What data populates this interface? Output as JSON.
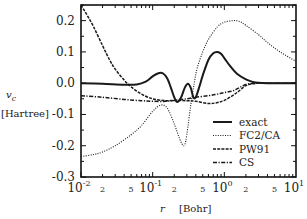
{
  "chart_data": {
    "type": "line",
    "title": "",
    "xlabel_symbol": "r",
    "xlabel_unit": "[Bohr]",
    "ylabel_symbol": "v",
    "ylabel_subscript": "c",
    "ylabel_unit": "[Hartree]",
    "xscale": "log",
    "xlim": [
      0.01,
      10
    ],
    "ylim": [
      -0.3,
      0.25
    ],
    "grid": false,
    "legend_position": "bottom-right",
    "x_major_ticks": [
      {
        "value": 0.01,
        "base": "10",
        "exp": "-2"
      },
      {
        "value": 0.1,
        "base": "10",
        "exp": "-1"
      },
      {
        "value": 1,
        "base": "10",
        "exp": "0"
      },
      {
        "value": 10,
        "base": "10",
        "exp": "1"
      }
    ],
    "x_minor_labels": [
      {
        "value": 0.02,
        "label": "2"
      },
      {
        "value": 0.05,
        "label": "5"
      },
      {
        "value": 0.2,
        "label": "2"
      },
      {
        "value": 0.5,
        "label": "5"
      },
      {
        "value": 2,
        "label": "2"
      },
      {
        "value": 5,
        "label": "5"
      }
    ],
    "y_ticks": [
      {
        "value": 0.2,
        "label": "0.2"
      },
      {
        "value": 0.1,
        "label": "0.1"
      },
      {
        "value": 0.0,
        "label": "0.0"
      },
      {
        "value": -0.1,
        "label": "-0.1"
      },
      {
        "value": -0.2,
        "label": "-0.2"
      },
      {
        "value": -0.3,
        "label": "-0.3"
      }
    ],
    "series": [
      {
        "name": "exact",
        "style": "solid",
        "x": [
          0.01,
          0.02,
          0.04,
          0.06,
          0.08,
          0.1,
          0.12,
          0.14,
          0.16,
          0.18,
          0.2,
          0.22,
          0.25,
          0.28,
          0.31,
          0.34,
          0.37,
          0.4,
          0.45,
          0.5,
          0.6,
          0.7,
          0.8,
          0.9,
          1.0,
          1.2,
          1.5,
          2.0,
          2.5,
          3.0,
          4.0,
          6.0,
          10.0
        ],
        "y": [
          0.0,
          -0.002,
          -0.005,
          -0.004,
          0.005,
          0.022,
          0.032,
          0.031,
          0.015,
          -0.015,
          -0.045,
          -0.06,
          -0.045,
          -0.015,
          -0.002,
          -0.015,
          -0.045,
          -0.045,
          -0.01,
          0.025,
          0.075,
          0.096,
          0.1,
          0.094,
          0.08,
          0.055,
          0.03,
          0.012,
          0.004,
          0.001,
          0.0,
          0.0,
          0.0
        ]
      },
      {
        "name": "FC2/CA",
        "style": "dotted",
        "x": [
          0.01,
          0.015,
          0.02,
          0.03,
          0.05,
          0.07,
          0.1,
          0.13,
          0.16,
          0.2,
          0.24,
          0.27,
          0.29,
          0.31,
          0.34,
          0.38,
          0.42,
          0.5,
          0.6,
          0.8,
          1.0,
          1.3,
          1.6,
          2.0,
          3.0,
          4.0,
          6.0,
          10.0
        ],
        "y": [
          -0.235,
          -0.228,
          -0.22,
          -0.2,
          -0.165,
          -0.135,
          -0.09,
          -0.07,
          -0.08,
          -0.13,
          -0.18,
          -0.2,
          -0.185,
          -0.14,
          -0.07,
          0.0,
          0.05,
          0.1,
          0.14,
          0.18,
          0.195,
          0.2,
          0.198,
          0.185,
          0.155,
          0.13,
          0.1,
          0.07
        ]
      },
      {
        "name": "PW91",
        "style": "dashed",
        "x": [
          0.01,
          0.012,
          0.015,
          0.02,
          0.025,
          0.03,
          0.04,
          0.05,
          0.07,
          0.1,
          0.15,
          0.2,
          0.3,
          0.4,
          0.6,
          0.8,
          1.0,
          1.3,
          1.6,
          2.0,
          2.5,
          3.0,
          4.0,
          6.0,
          10.0
        ],
        "y": [
          0.25,
          0.22,
          0.18,
          0.12,
          0.075,
          0.045,
          0.01,
          -0.012,
          -0.035,
          -0.05,
          -0.056,
          -0.055,
          -0.056,
          -0.058,
          -0.065,
          -0.062,
          -0.055,
          -0.04,
          -0.025,
          -0.008,
          -0.002,
          0.0,
          0.0,
          0.0,
          0.0
        ]
      },
      {
        "name": "CS",
        "style": "dash-dot",
        "x": [
          0.01,
          0.02,
          0.04,
          0.07,
          0.1,
          0.15,
          0.2,
          0.3,
          0.4,
          0.6,
          0.8,
          1.0,
          1.3,
          1.6,
          2.0,
          2.5,
          3.0,
          4.0,
          6.0,
          10.0
        ],
        "y": [
          -0.04,
          -0.045,
          -0.052,
          -0.056,
          -0.058,
          -0.058,
          -0.055,
          -0.05,
          -0.045,
          -0.04,
          -0.035,
          -0.03,
          -0.025,
          -0.015,
          -0.004,
          0.0,
          0.0,
          0.0,
          0.0,
          0.0
        ]
      }
    ]
  }
}
